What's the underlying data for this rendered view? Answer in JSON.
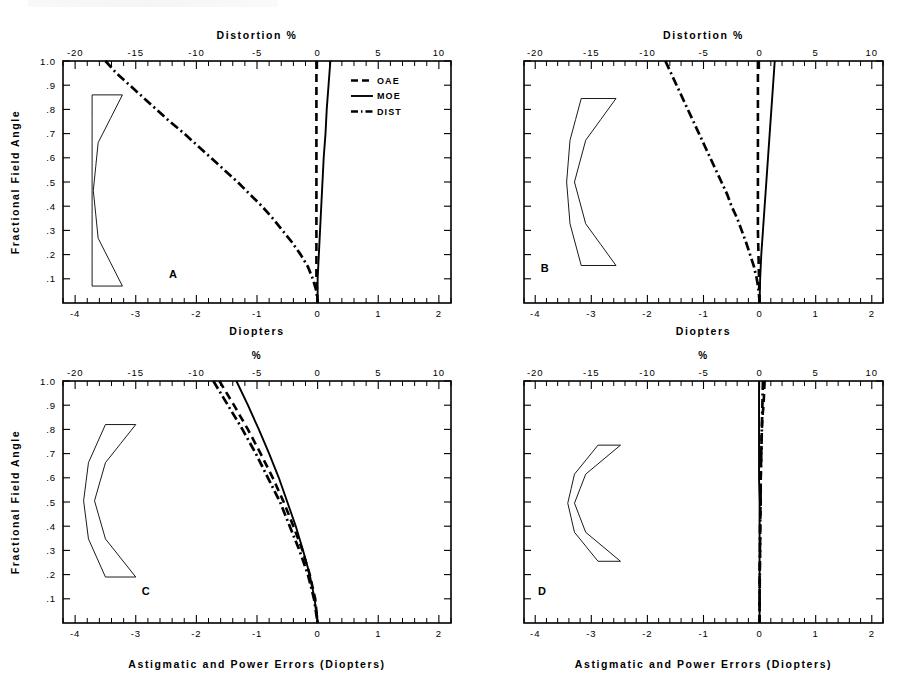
{
  "figure": {
    "panels": [
      "A",
      "B",
      "C",
      "D"
    ],
    "legend": {
      "entries": [
        {
          "label": "OAE",
          "style": "dashed"
        },
        {
          "label": "MOE",
          "style": "solid"
        },
        {
          "label": "DIST",
          "style": "dash-dot"
        }
      ]
    }
  },
  "axes": {
    "y_label": "Fractional Field Angle",
    "y_ticks": [
      "1.0",
      ".9",
      ".8",
      ".7",
      ".6",
      ".5",
      ".4",
      ".3",
      ".2",
      ".1"
    ],
    "y_values": [
      1.0,
      0.9,
      0.8,
      0.7,
      0.6,
      0.5,
      0.4,
      0.3,
      0.2,
      0.1
    ],
    "y_range": [
      0.0,
      1.0
    ],
    "top_ticks": [
      "-20",
      "-15",
      "-10",
      "-5",
      "0",
      "5",
      "10"
    ],
    "top_values": [
      -20,
      -15,
      -10,
      -5,
      0,
      5,
      10
    ],
    "top_range": [
      -21,
      11
    ],
    "bottom_ticks": [
      "-4",
      "-3",
      "-2",
      "-1",
      "0",
      "1",
      "2"
    ],
    "bottom_values": [
      -4,
      -3,
      -2,
      -1,
      0,
      1,
      2
    ],
    "bottom_range": [
      -4.2,
      2.2
    ],
    "top_label_ab": "Distortion %",
    "top_label_cd": "%",
    "bottom_label_ab": "Diopters",
    "bottom_label_cd": "Astigmatic and Power Errors (Diopters)"
  },
  "chart_data": [
    {
      "type": "line",
      "panel": "A",
      "title": "Distortion %",
      "xlabel": "Diopters",
      "ylabel": "Fractional Field Angle",
      "xlim": [
        -4.2,
        2.2
      ],
      "ylim": [
        0.0,
        1.0
      ],
      "x2lim": [
        -21,
        11
      ],
      "x2label": "Distortion %",
      "grid": false,
      "legend_position": "upper-right",
      "series": [
        {
          "name": "OAE",
          "axis": "diopters",
          "style": "dashed",
          "y": [
            1.0,
            0.9,
            0.8,
            0.7,
            0.6,
            0.5,
            0.4,
            0.3,
            0.2,
            0.15,
            0.1,
            0.05,
            0.0
          ],
          "values": [
            -0.02,
            -0.02,
            -0.02,
            -0.02,
            -0.02,
            -0.02,
            -0.02,
            -0.02,
            -0.02,
            -0.02,
            -0.02,
            -0.01,
            0.0
          ]
        },
        {
          "name": "MOE",
          "axis": "diopters",
          "style": "solid",
          "y": [
            1.0,
            0.9,
            0.8,
            0.7,
            0.6,
            0.5,
            0.4,
            0.3,
            0.2,
            0.15,
            0.1,
            0.05,
            0.0
          ],
          "values": [
            0.21,
            0.18,
            0.15,
            0.13,
            0.1,
            0.08,
            0.06,
            0.04,
            0.02,
            0.01,
            0.0,
            0.0,
            0.0
          ]
        },
        {
          "name": "DIST",
          "axis": "percent",
          "style": "dash-dot",
          "y": [
            1.0,
            0.95,
            0.9,
            0.85,
            0.8,
            0.75,
            0.7,
            0.65,
            0.6,
            0.55,
            0.5,
            0.45,
            0.4,
            0.35,
            0.3,
            0.25,
            0.2,
            0.15,
            0.1,
            0.05,
            0.0
          ],
          "values": [
            -17.5,
            -16.6,
            -15.5,
            -14.4,
            -13.3,
            -12.2,
            -11.0,
            -9.9,
            -8.8,
            -7.7,
            -6.6,
            -5.6,
            -4.6,
            -3.7,
            -2.9,
            -2.1,
            -1.4,
            -0.8,
            -0.4,
            -0.1,
            0.0
          ]
        }
      ],
      "lens_outline": {
        "y_top": 0.86,
        "y_bottom": 0.07,
        "front_x": [
          -3.72,
          -3.72,
          -3.72,
          -3.72,
          -3.72
        ],
        "back_x": [
          -3.22,
          -3.62,
          -3.7,
          -3.62,
          -3.22
        ],
        "shape": "plano-concave-crescent"
      }
    },
    {
      "type": "line",
      "panel": "B",
      "title": "Distortion %",
      "xlabel": "Diopters",
      "ylabel": "Fractional Field Angle",
      "xlim": [
        -4.2,
        2.2
      ],
      "ylim": [
        0.0,
        1.0
      ],
      "x2lim": [
        -21,
        11
      ],
      "x2label": "Distortion %",
      "grid": false,
      "series": [
        {
          "name": "OAE",
          "axis": "diopters",
          "style": "dashed",
          "y": [
            1.0,
            0.9,
            0.8,
            0.7,
            0.6,
            0.5,
            0.4,
            0.3,
            0.2,
            0.1,
            0.0
          ],
          "values": [
            -0.03,
            -0.03,
            -0.03,
            -0.03,
            -0.03,
            -0.03,
            -0.03,
            -0.03,
            -0.02,
            -0.01,
            0.0
          ]
        },
        {
          "name": "MOE",
          "axis": "diopters",
          "style": "solid",
          "y": [
            1.0,
            0.9,
            0.8,
            0.7,
            0.6,
            0.5,
            0.4,
            0.3,
            0.2,
            0.1,
            0.0
          ],
          "values": [
            0.27,
            0.24,
            0.21,
            0.18,
            0.15,
            0.12,
            0.09,
            0.06,
            0.03,
            0.01,
            0.0
          ]
        },
        {
          "name": "DIST",
          "axis": "percent",
          "style": "dash-dot",
          "y": [
            1.0,
            0.95,
            0.9,
            0.85,
            0.8,
            0.75,
            0.7,
            0.65,
            0.6,
            0.55,
            0.5,
            0.45,
            0.4,
            0.35,
            0.3,
            0.25,
            0.2,
            0.15,
            0.1,
            0.05,
            0.0
          ],
          "values": [
            -8.4,
            -7.9,
            -7.4,
            -6.9,
            -6.4,
            -5.9,
            -5.4,
            -4.9,
            -4.4,
            -3.9,
            -3.4,
            -2.9,
            -2.5,
            -2.0,
            -1.6,
            -1.2,
            -0.85,
            -0.5,
            -0.25,
            -0.08,
            0.0
          ]
        }
      ],
      "lens_outline": {
        "y_top": 0.845,
        "y_bottom": 0.155,
        "front_x": [
          -3.18,
          -3.38,
          -3.44,
          -3.38,
          -3.18
        ],
        "back_x": [
          -2.56,
          -3.1,
          -3.3,
          -3.1,
          -2.56
        ],
        "shape": "meniscus-crescent"
      }
    },
    {
      "type": "line",
      "panel": "C",
      "title": "%",
      "xlabel": "Astigmatic and Power Errors (Diopters)",
      "ylabel": "Fractional Field Angle",
      "xlim": [
        -4.2,
        2.2
      ],
      "ylim": [
        0.0,
        1.0
      ],
      "x2lim": [
        -21,
        11
      ],
      "x2label": "%",
      "grid": false,
      "series": [
        {
          "name": "OAE",
          "axis": "diopters",
          "style": "dashed",
          "y": [
            1.0,
            0.9,
            0.8,
            0.7,
            0.6,
            0.5,
            0.4,
            0.3,
            0.2,
            0.1,
            0.0
          ],
          "values": [
            -1.62,
            -1.38,
            -1.15,
            -0.94,
            -0.74,
            -0.56,
            -0.4,
            -0.25,
            -0.13,
            -0.04,
            0.0
          ]
        },
        {
          "name": "MOE",
          "axis": "diopters",
          "style": "solid",
          "y": [
            1.0,
            0.9,
            0.8,
            0.7,
            0.6,
            0.5,
            0.4,
            0.3,
            0.2,
            0.1,
            0.0
          ],
          "values": [
            -1.34,
            -1.15,
            -0.97,
            -0.8,
            -0.64,
            -0.5,
            -0.36,
            -0.24,
            -0.13,
            -0.05,
            0.0
          ]
        },
        {
          "name": "DIST",
          "axis": "percent",
          "style": "dash-dot",
          "y": [
            1.0,
            0.9,
            0.8,
            0.7,
            0.6,
            0.5,
            0.4,
            0.3,
            0.2,
            0.1,
            0.0
          ],
          "values": [
            -8.6,
            -7.4,
            -6.2,
            -5.1,
            -4.1,
            -3.1,
            -2.3,
            -1.5,
            -0.8,
            -0.3,
            0.0
          ]
        }
      ],
      "lens_outline": {
        "y_top": 0.82,
        "y_bottom": 0.19,
        "front_x": [
          -3.5,
          -3.78,
          -3.86,
          -3.78,
          -3.5
        ],
        "back_x": [
          -3.0,
          -3.5,
          -3.68,
          -3.5,
          -3.0
        ],
        "shape": "meniscus-crescent"
      }
    },
    {
      "type": "line",
      "panel": "D",
      "title": "%",
      "xlabel": "Astigmatic and Power Errors (Diopters)",
      "ylabel": "Fractional Field Angle",
      "xlim": [
        -4.2,
        2.2
      ],
      "ylim": [
        0.0,
        1.0
      ],
      "x2lim": [
        -21,
        11
      ],
      "x2label": "%",
      "grid": false,
      "series": [
        {
          "name": "OAE",
          "axis": "diopters",
          "style": "dashed",
          "y": [
            1.0,
            0.95,
            0.9,
            0.85,
            0.8,
            0.7,
            0.6,
            0.5,
            0.4,
            0.3,
            0.2,
            0.1,
            0.0
          ],
          "values": [
            0.09,
            0.08,
            0.07,
            0.05,
            0.04,
            0.03,
            0.02,
            0.02,
            0.01,
            0.01,
            0.0,
            0.0,
            0.0
          ]
        },
        {
          "name": "MOE",
          "axis": "diopters",
          "style": "solid",
          "y": [
            1.0,
            0.9,
            0.8,
            0.7,
            0.6,
            0.5,
            0.4,
            0.3,
            0.2,
            0.1,
            0.0
          ],
          "values": [
            -0.01,
            -0.01,
            -0.01,
            -0.01,
            -0.01,
            0.0,
            0.0,
            0.0,
            0.0,
            0.0,
            0.0
          ]
        },
        {
          "name": "DIST",
          "axis": "percent",
          "style": "dash-dot",
          "y": [
            1.0,
            0.9,
            0.8,
            0.7,
            0.6,
            0.5,
            0.4,
            0.3,
            0.2,
            0.1,
            0.0
          ],
          "values": [
            0.3,
            0.25,
            0.2,
            0.15,
            0.1,
            0.08,
            0.05,
            0.03,
            0.02,
            0.0,
            0.0
          ]
        }
      ],
      "lens_outline": {
        "y_top": 0.735,
        "y_bottom": 0.255,
        "front_x": [
          -2.88,
          -3.3,
          -3.42,
          -3.3,
          -2.88
        ],
        "back_x": [
          -2.48,
          -3.1,
          -3.3,
          -3.1,
          -2.48
        ],
        "shape": "deep-meniscus"
      }
    }
  ]
}
